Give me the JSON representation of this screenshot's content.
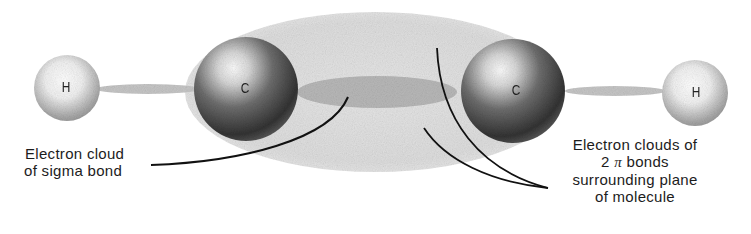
{
  "diagram": {
    "molecule": "H-C-C-H",
    "atoms": [
      {
        "symbol": "H",
        "role": "hydrogen-left"
      },
      {
        "symbol": "C",
        "role": "carbon-left"
      },
      {
        "symbol": "C",
        "role": "carbon-right"
      },
      {
        "symbol": "H",
        "role": "hydrogen-right"
      }
    ],
    "labels": {
      "sigma": {
        "line1": "Electron cloud",
        "line2": "of sigma bond"
      },
      "pi": {
        "line1": "Electron clouds of",
        "line2_num": "2",
        "line2_symbol": "π",
        "line2_rest": "bonds",
        "line3": "surrounding plane",
        "line4": "of molecule"
      }
    },
    "colors": {
      "background": "#ffffff",
      "pi_cloud": "#dcdcdc",
      "sigma_cloud": "#b9b9b9",
      "carbon_dark": "#3a3a3a",
      "hydrogen": "#9a9a9a",
      "leader_line": "#111111"
    }
  }
}
